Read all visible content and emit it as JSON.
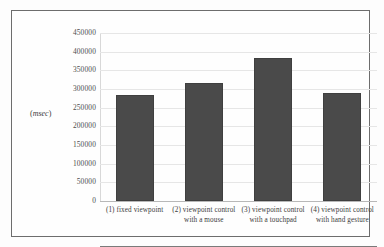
{
  "chart_data": {
    "type": "bar",
    "title": "",
    "xlabel": "",
    "ylabel": "(msec)",
    "ylim": [
      0,
      450000
    ],
    "grid": true,
    "legend": false,
    "categories": [
      "(1) fixed viewpoint",
      "(2) viewpoint control with a mouse",
      "(3) viewpoint control with a touchpad",
      "(4) viewpoint control with hand gesture"
    ],
    "values": [
      284000,
      316000,
      383000,
      289000
    ],
    "ytick_labels": [
      "450000",
      "400000",
      "350000",
      "300000",
      "250000",
      "200000",
      "150000",
      "100000",
      "50000",
      "0"
    ],
    "ytick_values": [
      450000,
      400000,
      350000,
      300000,
      250000,
      200000,
      150000,
      100000,
      50000,
      0
    ],
    "bar_color": "#4a4a4a",
    "gridline_color": "#e6e6e6",
    "axis_color": "#7a7a7a"
  },
  "axis_unit": {
    "open": "(",
    "text": "msec",
    "close": ")"
  }
}
